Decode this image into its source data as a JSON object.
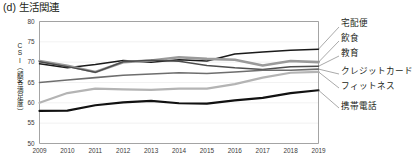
{
  "figure": {
    "title": "(d) 生活関連",
    "panel_id": "(d)",
    "panel_name": "生活関連"
  },
  "axes": {
    "y_label": "CSI（顧客満足度）",
    "y_label_chars": [
      "C",
      "S",
      "I",
      "（",
      "顧",
      "客",
      "満",
      "足",
      "度",
      "）"
    ],
    "y_ticks": [
      50,
      55,
      60,
      65,
      70,
      75,
      80
    ],
    "x_ticks": [
      2009,
      2010,
      2011,
      2012,
      2013,
      2014,
      2015,
      2016,
      2017,
      2018,
      2019
    ]
  },
  "colors": {
    "axis": "#8d8d8d",
    "grid": "#e9e9e9",
    "text": "#231f20",
    "takuhaibin": "#1a1a1a",
    "inshoku": "#9a9a9a",
    "kyoiku": "#4d4d4d",
    "credit_card": "#6e6e6e",
    "fitness": "#b4b4b4",
    "keitai_denwa": "#111111"
  },
  "chart_data": {
    "type": "line",
    "title": "(d) 生活関連",
    "xlabel": "",
    "ylabel": "CSI（顧客満足度）",
    "ylim": [
      50,
      80
    ],
    "xlim": [
      2009,
      2019
    ],
    "grid": true,
    "legend_position": "right-outside",
    "x": [
      2009,
      2010,
      2011,
      2012,
      2013,
      2014,
      2015,
      2016,
      2017,
      2018,
      2019
    ],
    "series": [
      {
        "name": "宅配便",
        "color": "#1a1a1a",
        "width": 1.5,
        "values": [
          69.6,
          68.6,
          69.4,
          70.4,
          70.0,
          70.6,
          70.3,
          72.0,
          72.5,
          72.9,
          73.2
        ]
      },
      {
        "name": "飲食",
        "color": "#9a9a9a",
        "width": 2.6,
        "values": [
          70.3,
          69.1,
          67.6,
          70.0,
          70.4,
          71.2,
          70.8,
          70.6,
          69.2,
          70.3,
          70.0
        ]
      },
      {
        "name": "教育",
        "color": "#4d4d4d",
        "width": 1.5,
        "values": [
          70.1,
          68.9,
          67.5,
          70.1,
          70.5,
          70.2,
          69.2,
          68.6,
          68.2,
          68.9,
          69.0
        ]
      },
      {
        "name": "クレジットカード",
        "color": "#6e6e6e",
        "width": 1.6,
        "values": [
          65.0,
          65.6,
          66.2,
          66.8,
          67.1,
          67.4,
          67.2,
          67.6,
          68.0,
          68.0,
          68.3
        ]
      },
      {
        "name": "フィットネス",
        "color": "#b4b4b4",
        "width": 2.2,
        "values": [
          60.0,
          62.4,
          63.5,
          63.3,
          63.2,
          63.5,
          63.5,
          64.6,
          66.2,
          67.4,
          67.6
        ]
      },
      {
        "name": "携帯電話",
        "color": "#111111",
        "width": 2.2,
        "values": [
          58.0,
          58.1,
          59.4,
          60.1,
          60.5,
          59.9,
          59.8,
          60.6,
          61.2,
          62.4,
          63.1
        ]
      }
    ]
  },
  "legend": [
    {
      "label": "宅配便",
      "top": 22
    },
    {
      "label": "飲食",
      "top": 36
    },
    {
      "label": "教育",
      "top": 51
    },
    {
      "label": "クレジットカード",
      "top": 69
    },
    {
      "label": "フィットネス",
      "top": 83
    },
    {
      "label": "携帯電話",
      "top": 103
    }
  ]
}
